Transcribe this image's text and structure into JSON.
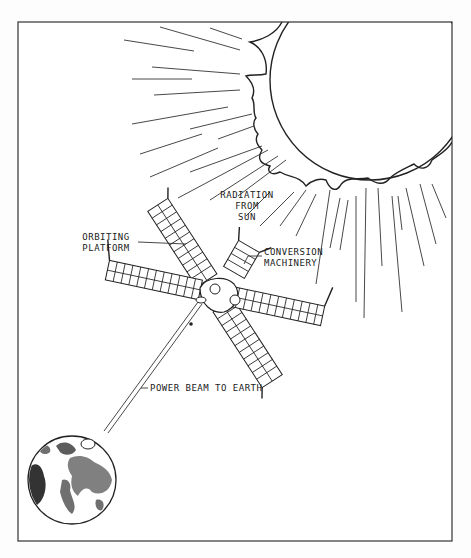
{
  "diagram": {
    "type": "illustration",
    "labels": {
      "radiation": [
        "RADIATION",
        "FROM",
        "SUN"
      ],
      "platform": [
        "ORBITING",
        "PLATFORM"
      ],
      "conversion": [
        "CONVERSION",
        "MACHINERY"
      ],
      "beam": "POWER BEAM TO EARTH"
    },
    "elements": [
      {
        "name": "sun",
        "description": "Large circle in upper right with irregular corona edge"
      },
      {
        "name": "radiation-rays",
        "description": "Straight lines radiating from sun toward lower left"
      },
      {
        "name": "orbiting-platform",
        "description": "X-shaped satellite with four gridded solar panel arms"
      },
      {
        "name": "conversion-machinery",
        "description": "Hub module at center of platform"
      },
      {
        "name": "power-beam",
        "description": "Double line from platform to Earth"
      },
      {
        "name": "earth",
        "description": "Globe in lower left showing continents"
      }
    ],
    "colors": {
      "ink": "#222222",
      "background": "#fdfdfd"
    }
  }
}
